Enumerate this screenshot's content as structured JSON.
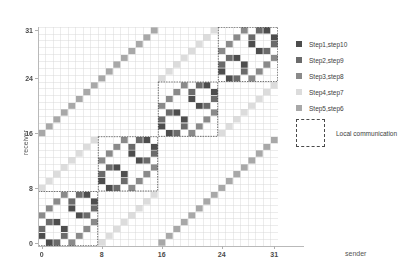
{
  "chart_data": {
    "type": "heatmap",
    "title": "",
    "xlabel": "sender",
    "ylabel": "receiver",
    "xlim": [
      0,
      32
    ],
    "ylim": [
      0,
      32
    ],
    "xticks": [
      "0",
      "8",
      "16",
      "24",
      "31"
    ],
    "xtick_values": [
      0,
      8,
      16,
      24,
      31
    ],
    "yticks": [
      "0",
      "8",
      "16",
      "24",
      "31"
    ],
    "ytick_values": [
      0,
      8,
      16,
      24,
      31
    ],
    "grid": true,
    "legend_position": "right",
    "n_nodes": 32,
    "legend": [
      {
        "label": "Step1,step10",
        "color": "#4d4d4d",
        "steps": [
          1,
          10
        ],
        "bit": 0
      },
      {
        "label": "Step2,step9",
        "color": "#6b6b6b",
        "steps": [
          2,
          9
        ],
        "bit": 1
      },
      {
        "label": "Step3,step8",
        "color": "#8a8a8a",
        "steps": [
          3,
          8
        ],
        "bit": 2
      },
      {
        "label": "Step4,step7",
        "color": "#dcdcdc",
        "steps": [
          4,
          7
        ],
        "bit": 3
      },
      {
        "label": "Step5,step6",
        "color": "#a8a8a8",
        "steps": [
          5,
          6
        ],
        "bit": 4
      }
    ],
    "local_communication": {
      "label": "Local communication",
      "style": "dashed-square",
      "color": "#4a4a4a",
      "blocks": [
        {
          "x0": 0,
          "y0": 0,
          "size": 8
        },
        {
          "x0": 8,
          "y0": 8,
          "size": 8
        },
        {
          "x0": 16,
          "y0": 16,
          "size": 8
        },
        {
          "x0": 24,
          "y0": 24,
          "size": 8
        }
      ]
    },
    "cell_rule": "cell (s,r) is colored when r = s XOR 2^bit, color taken from the legend entry matching that bit",
    "bits": [
      0,
      1,
      2,
      3,
      4
    ],
    "grid_color": "#d8d8d8",
    "axis_color": "#b9b9b9",
    "background": "#ffffff"
  }
}
